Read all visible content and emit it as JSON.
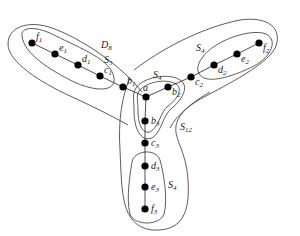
{
  "diagram": {
    "type": "tree-with-separator-sets",
    "nodes": [
      {
        "id": "f1",
        "base": "f",
        "sub": "1",
        "x": 32,
        "y": 43
      },
      {
        "id": "e1",
        "base": "e",
        "sub": "1",
        "x": 55,
        "y": 54
      },
      {
        "id": "d1",
        "base": "d",
        "sub": "1",
        "x": 78,
        "y": 65
      },
      {
        "id": "c1",
        "base": "c",
        "sub": "1",
        "x": 100,
        "y": 76
      },
      {
        "id": "b1",
        "base": "b",
        "sub": "1",
        "x": 123,
        "y": 87
      },
      {
        "id": "a",
        "base": "a",
        "sub": "",
        "x": 146,
        "y": 97
      },
      {
        "id": "b2",
        "base": "b",
        "sub": "2",
        "x": 168,
        "y": 87
      },
      {
        "id": "c2",
        "base": "c",
        "sub": "2",
        "x": 191,
        "y": 77
      },
      {
        "id": "d2",
        "base": "d",
        "sub": "2",
        "x": 214,
        "y": 65
      },
      {
        "id": "e2",
        "base": "e",
        "sub": "2",
        "x": 237,
        "y": 54
      },
      {
        "id": "f2",
        "base": "f",
        "sub": "2",
        "x": 259,
        "y": 43
      },
      {
        "id": "b3",
        "base": "b",
        "sub": "3",
        "x": 145,
        "y": 121
      },
      {
        "id": "c3",
        "base": "c",
        "sub": "3",
        "x": 145,
        "y": 143
      },
      {
        "id": "d3",
        "base": "d",
        "sub": "3",
        "x": 145,
        "y": 166
      },
      {
        "id": "e3",
        "base": "e",
        "sub": "3",
        "x": 145,
        "y": 187
      },
      {
        "id": "f3",
        "base": "f",
        "sub": "3",
        "x": 145,
        "y": 209
      }
    ],
    "edges": [
      [
        "f1",
        "e1"
      ],
      [
        "e1",
        "d1"
      ],
      [
        "d1",
        "c1"
      ],
      [
        "c1",
        "b1"
      ],
      [
        "b1",
        "a"
      ],
      [
        "a",
        "b2"
      ],
      [
        "b2",
        "c2"
      ],
      [
        "c2",
        "d2"
      ],
      [
        "d2",
        "e2"
      ],
      [
        "e2",
        "f2"
      ],
      [
        "a",
        "b3"
      ],
      [
        "b3",
        "c3"
      ],
      [
        "c3",
        "d3"
      ],
      [
        "d3",
        "e3"
      ],
      [
        "e3",
        "f3"
      ]
    ],
    "set_labels": [
      {
        "id": "D8",
        "base": "D",
        "sub": "8",
        "x": 101,
        "y": 48
      },
      {
        "id": "S5",
        "base": "S",
        "sub": "5",
        "x": 104,
        "y": 63
      },
      {
        "id": "S4_right",
        "base": "S",
        "sub": "4",
        "x": 196,
        "y": 51
      },
      {
        "id": "S4_center",
        "base": "S",
        "sub": "4",
        "x": 153,
        "y": 78
      },
      {
        "id": "S12",
        "base": "S",
        "sub": "12",
        "x": 180,
        "y": 130
      },
      {
        "id": "S4_bottom",
        "base": "S",
        "sub": "4",
        "x": 168,
        "y": 188
      }
    ]
  }
}
